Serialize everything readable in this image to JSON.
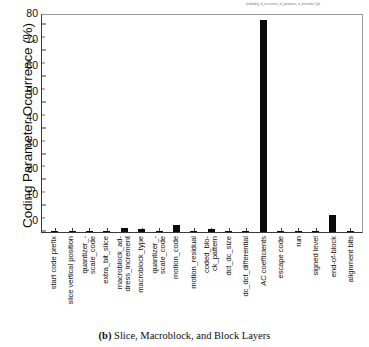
{
  "figure": {
    "header_note": "probability_of_occurrence_of_parameter_in_bitstream-2.gle",
    "caption_prefix": "(b)",
    "caption_text": "Slice, Macroblock, and Block Layers"
  },
  "chart_data": {
    "type": "bar",
    "title": "",
    "xlabel": "",
    "ylabel": "Coding Parameter Occurrence (%)",
    "ylim": [
      0,
      84
    ],
    "yticks": [
      0,
      10,
      20,
      30,
      40,
      50,
      60,
      70,
      80
    ],
    "ytick_labels": [
      "0",
      "10",
      "20",
      "30",
      "40",
      "50",
      "60",
      "70",
      "80"
    ],
    "grid": false,
    "legend": false,
    "bar_color": "#0a0a0a",
    "categories": [
      "start code prefix",
      "slice vertical position",
      "quantizer_-scale_code",
      "extra_bit_slice",
      "macroblock_ad-dress_increment",
      "macroblock_type",
      "quantizer_-scale_code",
      "motion_code",
      "motion_residual",
      "coded_blo-ck_pattern",
      "dct_dc_size",
      "dc_dct_differential",
      "AC coefficients",
      "escape code",
      "run",
      "signed level",
      "end-of-block",
      "alignment bits"
    ],
    "category_lines": [
      [
        "start code prefix"
      ],
      [
        "slice vertical position"
      ],
      [
        "quantizer_-",
        "scale_code"
      ],
      [
        "extra_bit_slice"
      ],
      [
        "macroblock_ad-",
        "dress_increment"
      ],
      [
        "macroblock_type"
      ],
      [
        "quantizer_-",
        "scale_code"
      ],
      [
        "motion_code"
      ],
      [
        "motion_residual"
      ],
      [
        "coded_blo-",
        "ck_pattern"
      ],
      [
        "dct_dc_size"
      ],
      [
        "dc_dct_differential"
      ],
      [
        "AC coefficients"
      ],
      [
        "escape code"
      ],
      [
        "run"
      ],
      [
        "signed level"
      ],
      [
        "end-of-block"
      ],
      [
        "alignment bits"
      ]
    ],
    "values": [
      0.08,
      0.08,
      0.1,
      0.12,
      1.4,
      1.3,
      0.5,
      2.8,
      0.12,
      1.1,
      0.4,
      0.12,
      82.0,
      0.25,
      0.1,
      0.15,
      6.5,
      0.08
    ]
  }
}
